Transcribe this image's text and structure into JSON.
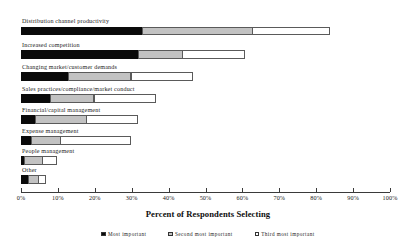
{
  "chart_data": {
    "type": "bar",
    "orientation": "horizontal",
    "stacked": true,
    "title": "",
    "xlabel": "Percent of Respondents Selecting",
    "ylabel": "",
    "xlim": [
      0,
      100
    ],
    "xticks": [
      "0%",
      "10%",
      "20%",
      "30%",
      "40%",
      "50%",
      "60%",
      "70%",
      "80%",
      "90%",
      "100%"
    ],
    "xtick_values": [
      0,
      10,
      20,
      30,
      40,
      50,
      60,
      70,
      80,
      90,
      100
    ],
    "grid": false,
    "legend_position": "bottom",
    "categories": [
      "Distribution channel productivity",
      "Increased competition",
      "Changing market/customer demands",
      "Sales practices/compliance/market conduct",
      "Financial/capital  management",
      "Expense  management",
      "People  management",
      "Other"
    ],
    "series": [
      {
        "name": "Most important",
        "color": "#0a0a0a",
        "values": [
          33,
          32,
          13,
          8,
          4,
          3,
          1,
          2
        ]
      },
      {
        "name": "Second most important",
        "color": "#c2c2c2",
        "values": [
          30,
          12,
          17,
          12,
          14,
          8,
          5,
          3
        ]
      },
      {
        "name": "Third most important",
        "color": "#ffffff",
        "values": [
          21,
          17,
          17,
          17,
          14,
          19,
          4,
          2
        ]
      }
    ]
  },
  "legend": {
    "items": [
      {
        "label": "Most important",
        "swatch": "#0a0a0a"
      },
      {
        "label": "Second most important",
        "swatch": "#c2c2c2"
      },
      {
        "label": "Third most important",
        "swatch": "#ffffff"
      }
    ]
  }
}
